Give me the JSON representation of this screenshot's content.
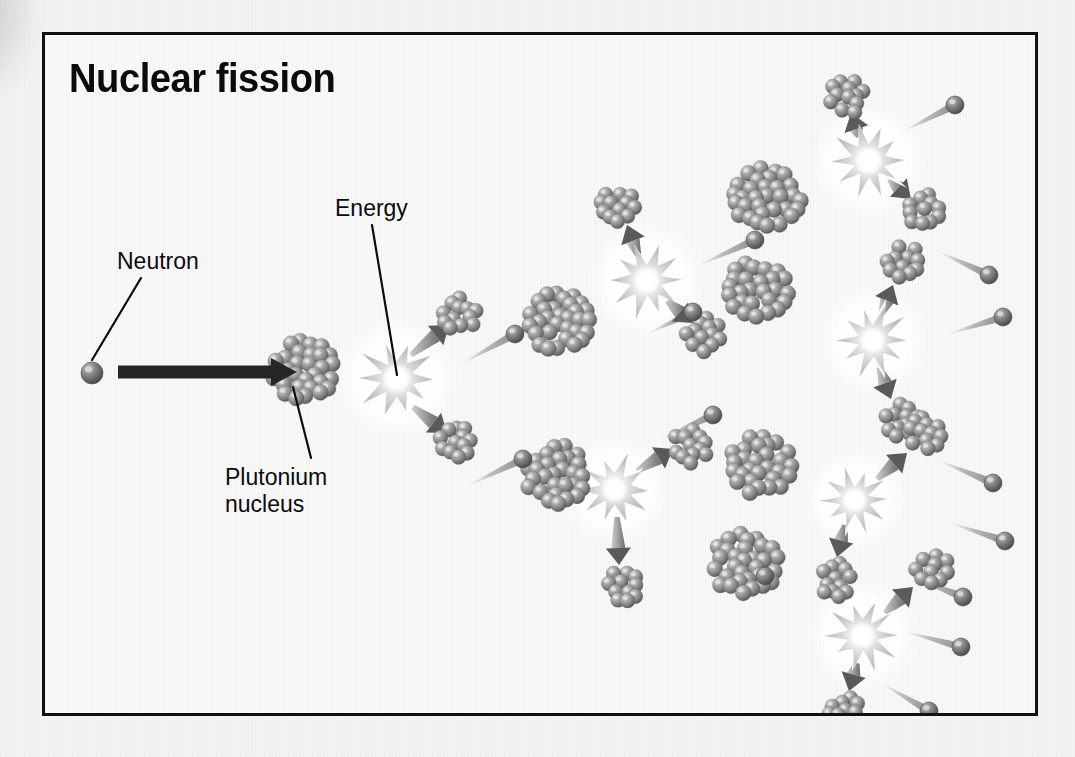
{
  "figure": {
    "title": "Nuclear fission",
    "border_color": "#111111",
    "background_color": "#f8f8f8"
  },
  "labels": [
    {
      "id": "neutron",
      "text": "Neutron",
      "x": 72,
      "y": 213
    },
    {
      "id": "energy",
      "text": "Energy",
      "x": 290,
      "y": 160
    },
    {
      "id": "plutonium",
      "text": "Plutonium\nnucleus",
      "x": 180,
      "y": 429
    }
  ],
  "leader_lines": [
    {
      "from_label": "neutron",
      "x1": 96,
      "y1": 243,
      "x2": 47,
      "y2": 325
    },
    {
      "from_label": "energy",
      "x1": 327,
      "y1": 190,
      "x2": 352,
      "y2": 340
    },
    {
      "from_label": "plutonium",
      "x1": 266,
      "y1": 423,
      "x2": 248,
      "y2": 352
    }
  ],
  "colors": {
    "nucleon_dark": "#6f6f6f",
    "nucleon_light": "#c9c9c9",
    "neutron_dark": "#5e5e5e",
    "arrow_gray": "#8a8a8a",
    "arrow_head": "#555555",
    "burst_gray": "#c2c2c2",
    "burst_core": "#ffffff",
    "incident_arrow": "#262626",
    "text": "#0b0b0b"
  },
  "incident_arrow": {
    "x1": 55,
    "y1": 337,
    "x2": 252,
    "y2": 337,
    "width": 13
  },
  "nuclei": [
    {
      "id": "pu-0",
      "cx": 258,
      "cy": 335,
      "r": 36,
      "type": "plutonium"
    },
    {
      "id": "pu-1",
      "cx": 514,
      "cy": 287,
      "r": 36,
      "type": "plutonium"
    },
    {
      "id": "pu-2",
      "cx": 512,
      "cy": 440,
      "r": 36,
      "type": "plutonium"
    },
    {
      "id": "pu-3",
      "cx": 722,
      "cy": 165,
      "r": 38,
      "type": "plutonium"
    },
    {
      "id": "pu-4",
      "cx": 713,
      "cy": 255,
      "r": 36,
      "type": "plutonium"
    },
    {
      "id": "pu-5",
      "cx": 716,
      "cy": 430,
      "r": 36,
      "type": "plutonium"
    },
    {
      "id": "pu-6",
      "cx": 700,
      "cy": 530,
      "r": 38,
      "type": "plutonium"
    }
  ],
  "bursts": [
    {
      "id": "burst-0",
      "cx": 352,
      "cy": 343,
      "r": 38
    },
    {
      "id": "burst-1",
      "cx": 602,
      "cy": 245,
      "r": 36
    },
    {
      "id": "burst-2",
      "cx": 570,
      "cy": 455,
      "r": 34
    },
    {
      "id": "burst-3",
      "cx": 824,
      "cy": 126,
      "r": 36
    },
    {
      "id": "burst-4",
      "cx": 828,
      "cy": 305,
      "r": 34
    },
    {
      "id": "burst-5",
      "cx": 810,
      "cy": 465,
      "r": 32
    },
    {
      "id": "burst-6",
      "cx": 818,
      "cy": 600,
      "r": 34
    }
  ],
  "fragments": [
    {
      "id": "fr-0a",
      "cx": 415,
      "cy": 279,
      "r": 22
    },
    {
      "id": "fr-0b",
      "cx": 412,
      "cy": 406,
      "r": 21
    },
    {
      "id": "fr-1a",
      "cx": 572,
      "cy": 170,
      "r": 22
    },
    {
      "id": "fr-1b",
      "cx": 658,
      "cy": 300,
      "r": 22
    },
    {
      "id": "fr-2a",
      "cx": 645,
      "cy": 412,
      "r": 22
    },
    {
      "id": "fr-2b",
      "cx": 578,
      "cy": 552,
      "r": 21
    },
    {
      "id": "fr-3a",
      "cx": 802,
      "cy": 62,
      "r": 22
    },
    {
      "id": "fr-3b",
      "cx": 878,
      "cy": 176,
      "r": 22
    },
    {
      "id": "fr-4a",
      "cx": 860,
      "cy": 228,
      "r": 22
    },
    {
      "id": "fr-4b",
      "cx": 856,
      "cy": 386,
      "r": 22
    },
    {
      "id": "fr-5a",
      "cx": 882,
      "cy": 398,
      "r": 22
    },
    {
      "id": "fr-5b",
      "cx": 792,
      "cy": 545,
      "r": 22
    },
    {
      "id": "fr-6a",
      "cx": 888,
      "cy": 533,
      "r": 22
    },
    {
      "id": "fr-6b",
      "cx": 800,
      "cy": 676,
      "r": 22
    }
  ],
  "neutrons": [
    {
      "id": "n-incident",
      "cx": 47,
      "cy": 338,
      "r": 11,
      "trail": null
    },
    {
      "id": "n-0a",
      "cx": 470,
      "cy": 299,
      "r": 9,
      "trail": {
        "x": 414,
        "y": 330
      }
    },
    {
      "id": "n-0b",
      "cx": 478,
      "cy": 424,
      "r": 9,
      "trail": {
        "x": 420,
        "y": 452
      }
    },
    {
      "id": "n-1a",
      "cx": 710,
      "cy": 205,
      "r": 9,
      "trail": {
        "x": 650,
        "y": 232
      }
    },
    {
      "id": "n-1b",
      "cx": 648,
      "cy": 277,
      "r": 9,
      "trail": {
        "x": 600,
        "y": 300
      }
    },
    {
      "id": "n-2a",
      "cx": 720,
      "cy": 541,
      "r": 9,
      "trail": {
        "x": 662,
        "y": 512
      }
    },
    {
      "id": "n-2b",
      "cx": 668,
      "cy": 380,
      "r": 9,
      "trail": {
        "x": 612,
        "y": 406
      }
    },
    {
      "id": "n-3a",
      "cx": 910,
      "cy": 70,
      "r": 9,
      "trail": {
        "x": 855,
        "y": 98
      }
    },
    {
      "id": "n-3b",
      "cx": 944,
      "cy": 240,
      "r": 9,
      "trail": {
        "x": 890,
        "y": 215
      }
    },
    {
      "id": "n-4a",
      "cx": 958,
      "cy": 282,
      "r": 9,
      "trail": {
        "x": 900,
        "y": 300
      }
    },
    {
      "id": "n-4b",
      "cx": 948,
      "cy": 448,
      "r": 9,
      "trail": {
        "x": 890,
        "y": 424
      }
    },
    {
      "id": "n-5a",
      "cx": 960,
      "cy": 506,
      "r": 9,
      "trail": {
        "x": 902,
        "y": 487
      }
    },
    {
      "id": "n-5b",
      "cx": 918,
      "cy": 562,
      "r": 9,
      "trail": {
        "x": 862,
        "y": 540
      }
    },
    {
      "id": "n-6a",
      "cx": 916,
      "cy": 612,
      "r": 9,
      "trail": {
        "x": 858,
        "y": 596
      }
    },
    {
      "id": "n-6b",
      "cx": 884,
      "cy": 676,
      "r": 9,
      "trail": {
        "x": 836,
        "y": 648
      }
    }
  ],
  "fission_arrows": [
    {
      "id": "ar-0a",
      "x1": 366,
      "y1": 320,
      "x2": 404,
      "y2": 290
    },
    {
      "id": "ar-0b",
      "x1": 368,
      "y1": 372,
      "x2": 402,
      "y2": 398
    },
    {
      "id": "ar-1a",
      "x1": 594,
      "y1": 222,
      "x2": 582,
      "y2": 190
    },
    {
      "id": "ar-1b",
      "x1": 622,
      "y1": 266,
      "x2": 648,
      "y2": 288
    },
    {
      "id": "ar-2a",
      "x1": 592,
      "y1": 436,
      "x2": 628,
      "y2": 414
    },
    {
      "id": "ar-2b",
      "x1": 572,
      "y1": 482,
      "x2": 574,
      "y2": 530
    },
    {
      "id": "ar-3a",
      "x1": 814,
      "y1": 102,
      "x2": 806,
      "y2": 78
    },
    {
      "id": "ar-3b",
      "x1": 844,
      "y1": 144,
      "x2": 866,
      "y2": 164
    },
    {
      "id": "ar-4a",
      "x1": 836,
      "y1": 280,
      "x2": 848,
      "y2": 250
    },
    {
      "id": "ar-4b",
      "x1": 834,
      "y1": 332,
      "x2": 846,
      "y2": 364
    },
    {
      "id": "ar-5a",
      "x1": 832,
      "y1": 444,
      "x2": 862,
      "y2": 418
    },
    {
      "id": "ar-5b",
      "x1": 800,
      "y1": 490,
      "x2": 792,
      "y2": 522
    },
    {
      "id": "ar-6a",
      "x1": 840,
      "y1": 578,
      "x2": 868,
      "y2": 552
    },
    {
      "id": "ar-6b",
      "x1": 812,
      "y1": 628,
      "x2": 804,
      "y2": 656
    }
  ]
}
